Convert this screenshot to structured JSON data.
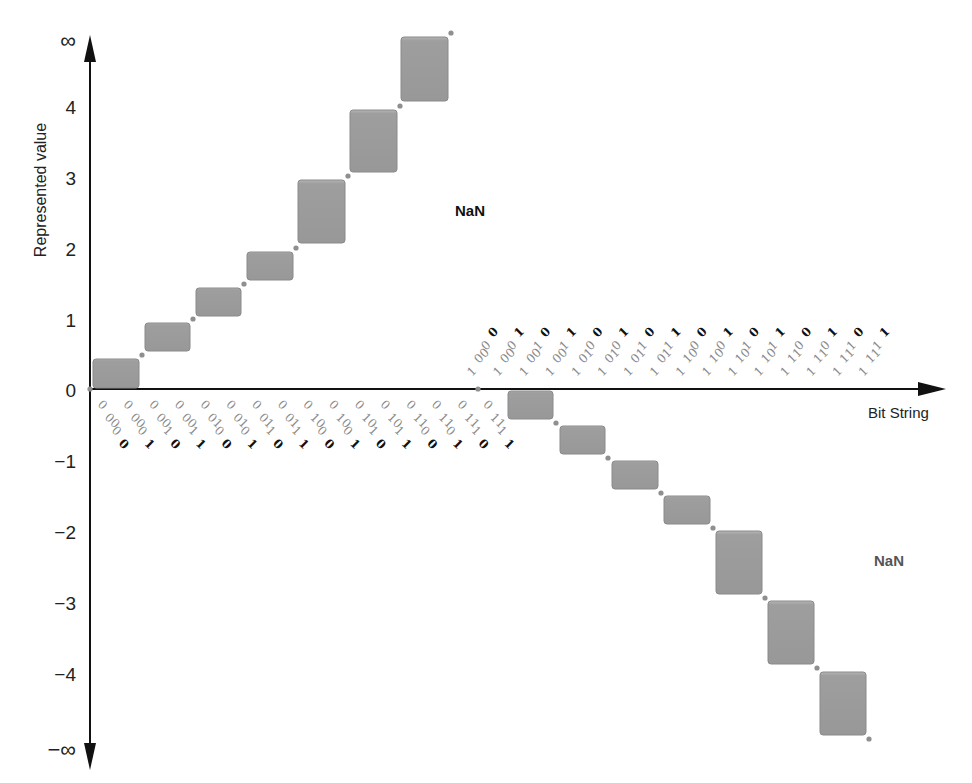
{
  "cropped_caption": "",
  "chart_data": {
    "type": "step",
    "title": "",
    "xlabel": "Bit String",
    "ylabel": "Represented value",
    "y_ticks": [
      "∞",
      "4",
      "3",
      "2",
      "1",
      "0",
      "−1",
      "−2",
      "−3",
      "−4",
      "−∞"
    ],
    "y_tick_values": [
      null,
      4,
      3,
      2,
      1,
      0,
      -1,
      -2,
      -3,
      -4,
      null
    ],
    "annotations": [
      {
        "text": "NaN",
        "position": "upper-right",
        "style": "bold-black"
      },
      {
        "text": "NaN",
        "position": "lower-right",
        "style": "bold-gray"
      }
    ],
    "positive_bit_strings": [
      "00000",
      "00001",
      "00010",
      "00011",
      "00100",
      "00101",
      "00110",
      "00111",
      "01000",
      "01001",
      "01010",
      "01011",
      "01100",
      "01101",
      "01110",
      "01111"
    ],
    "negative_bit_strings": [
      "10000",
      "10001",
      "10010",
      "10011",
      "10100",
      "10101",
      "10110",
      "10111",
      "11000",
      "11001",
      "11010",
      "11011",
      "11100",
      "11101",
      "11110",
      "11111"
    ],
    "positive_steps": [
      {
        "from": 0,
        "to": 0.5
      },
      {
        "from": 0.5,
        "to": 1
      },
      {
        "from": 1,
        "to": 1.5
      },
      {
        "from": 1.5,
        "to": 2
      },
      {
        "from": 2,
        "to": 3
      },
      {
        "from": 3,
        "to": 4
      },
      {
        "from": 4,
        "to": "∞"
      }
    ],
    "negative_steps": [
      {
        "from": 0,
        "to": -0.5
      },
      {
        "from": -0.5,
        "to": -1
      },
      {
        "from": -1,
        "to": -1.5
      },
      {
        "from": -1.5,
        "to": -2
      },
      {
        "from": -2,
        "to": -3
      },
      {
        "from": -3,
        "to": -4
      },
      {
        "from": -4,
        "to": "−∞"
      }
    ],
    "bit_format": "sign(1) exponent(2) mantissa(2)",
    "colors": {
      "box": "#9a9a9a",
      "dot": "#8f8f8f",
      "axis": "#111111",
      "bit_gray": "#8a8a8a",
      "bit_bold": "#111111"
    }
  }
}
